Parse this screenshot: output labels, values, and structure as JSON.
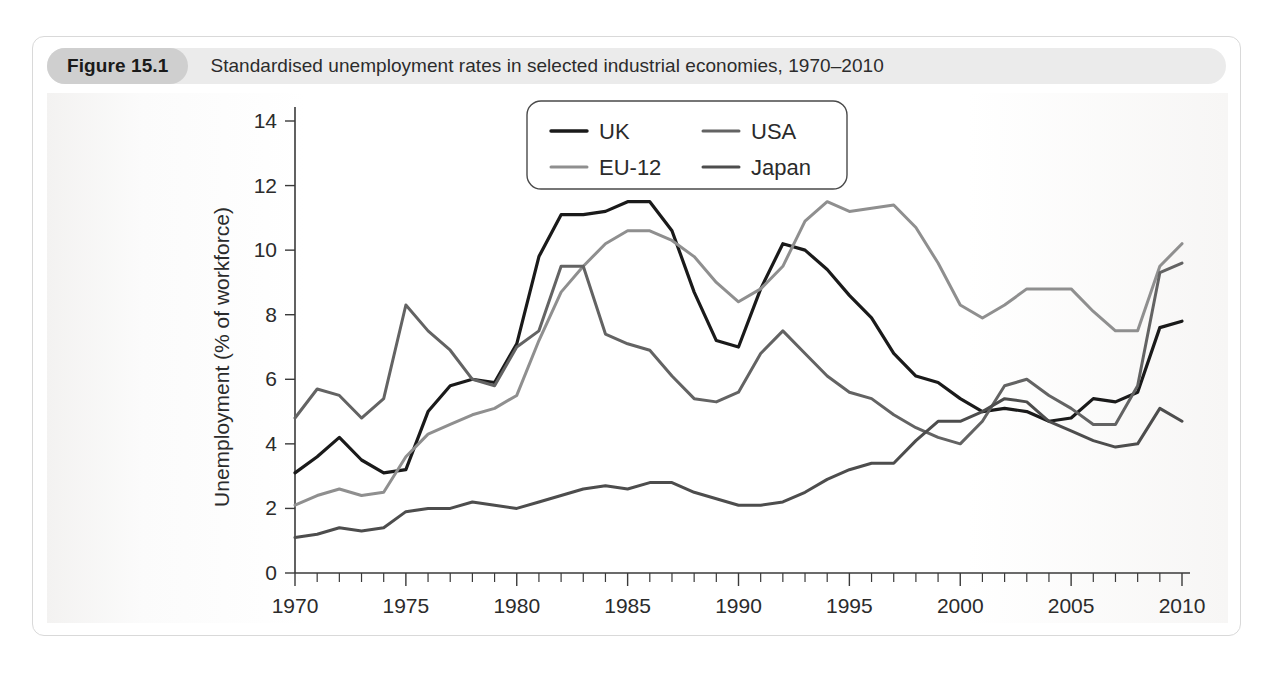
{
  "figure": {
    "number_label": "Figure 15.1",
    "title": "Standardised unemployment rates in selected industrial economies, 1970–2010"
  },
  "background_text": {
    "left_col": "",
    "right_col": ""
  },
  "chart_data": {
    "type": "line",
    "title": "Standardised unemployment rates in selected industrial economies, 1970–2010",
    "xlabel": "",
    "ylabel": "Unemployment (% of workforce)",
    "xlim": [
      1970,
      2010
    ],
    "ylim": [
      0,
      14
    ],
    "yticks": [
      0,
      2,
      4,
      6,
      8,
      10,
      12,
      14
    ],
    "xticks": [
      1970,
      1975,
      1980,
      1985,
      1990,
      1995,
      2000,
      2005,
      2010
    ],
    "xtick_minor_step": 1,
    "grid": false,
    "legend_position": "top-center-right",
    "x": [
      1970,
      1971,
      1972,
      1973,
      1974,
      1975,
      1976,
      1977,
      1978,
      1979,
      1980,
      1981,
      1982,
      1983,
      1984,
      1985,
      1986,
      1987,
      1988,
      1989,
      1990,
      1991,
      1992,
      1993,
      1994,
      1995,
      1996,
      1997,
      1998,
      1999,
      2000,
      2001,
      2002,
      2003,
      2004,
      2005,
      2006,
      2007,
      2008,
      2009,
      2010
    ],
    "series": [
      {
        "name": "UK",
        "color": "#1a1a1a",
        "width": 3.2,
        "values": [
          3.1,
          3.6,
          4.2,
          3.5,
          3.1,
          3.2,
          5.0,
          5.8,
          6.0,
          5.9,
          7.1,
          9.8,
          11.1,
          11.1,
          11.2,
          11.5,
          11.5,
          10.6,
          8.7,
          7.2,
          7.0,
          8.8,
          10.2,
          10.0,
          9.4,
          8.6,
          7.9,
          6.8,
          6.1,
          5.9,
          5.4,
          5.0,
          5.1,
          5.0,
          4.7,
          4.8,
          5.4,
          5.3,
          5.6,
          7.6,
          7.8
        ]
      },
      {
        "name": "EU-12",
        "color": "#8f8f8f",
        "width": 3.0,
        "values": [
          2.1,
          2.4,
          2.6,
          2.4,
          2.5,
          3.6,
          4.3,
          4.6,
          4.9,
          5.1,
          5.5,
          7.2,
          8.7,
          9.5,
          10.2,
          10.6,
          10.6,
          10.3,
          9.8,
          9.0,
          8.4,
          8.8,
          9.5,
          10.9,
          11.5,
          11.2,
          11.3,
          11.4,
          10.7,
          9.6,
          8.3,
          7.9,
          8.3,
          8.8,
          8.8,
          8.8,
          8.1,
          7.5,
          7.5,
          9.5,
          10.2
        ]
      },
      {
        "name": "USA",
        "color": "#636363",
        "width": 3.0,
        "values": [
          4.8,
          5.7,
          5.5,
          4.8,
          5.4,
          8.3,
          7.5,
          6.9,
          6.0,
          5.8,
          7.0,
          7.5,
          9.5,
          9.5,
          7.4,
          7.1,
          6.9,
          6.1,
          5.4,
          5.3,
          5.6,
          6.8,
          7.5,
          6.8,
          6.1,
          5.6,
          5.4,
          4.9,
          4.5,
          4.2,
          4.0,
          4.7,
          5.8,
          6.0,
          5.5,
          5.1,
          4.6,
          4.6,
          5.8,
          9.3,
          9.6
        ]
      },
      {
        "name": "Japan",
        "color": "#4d4d4d",
        "width": 3.0,
        "values": [
          1.1,
          1.2,
          1.4,
          1.3,
          1.4,
          1.9,
          2.0,
          2.0,
          2.2,
          2.1,
          2.0,
          2.2,
          2.4,
          2.6,
          2.7,
          2.6,
          2.8,
          2.8,
          2.5,
          2.3,
          2.1,
          2.1,
          2.2,
          2.5,
          2.9,
          3.2,
          3.4,
          3.4,
          4.1,
          4.7,
          4.7,
          5.0,
          5.4,
          5.3,
          4.7,
          4.4,
          4.1,
          3.9,
          4.0,
          5.1,
          4.7
        ]
      }
    ],
    "legend": [
      {
        "name": "UK",
        "color": "#1a1a1a"
      },
      {
        "name": "USA",
        "color": "#636363"
      },
      {
        "name": "EU-12",
        "color": "#8f8f8f"
      },
      {
        "name": "Japan",
        "color": "#4d4d4d"
      }
    ]
  }
}
